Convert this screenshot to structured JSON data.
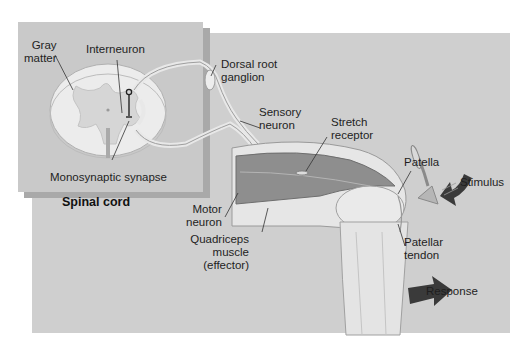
{
  "figure": {
    "inset_title": "Spinal cord",
    "colors": {
      "panel_bg": "#cfcfcf",
      "inset_bg": "#c9c9c9",
      "inset_shadow": "#a9a9a9",
      "arrow": "#3a3a3a",
      "label_text": "#1e1e1e"
    }
  },
  "labels": {
    "gray_matter": [
      "Gray",
      "matter"
    ],
    "interneuron": [
      "Interneuron"
    ],
    "dorsal_root_ganglion": [
      "Dorsal root",
      "ganglion"
    ],
    "sensory_neuron": [
      "Sensory",
      "neuron"
    ],
    "stretch_receptor": [
      "Stretch",
      "receptor"
    ],
    "patella": [
      "Patella"
    ],
    "stimulus": [
      "Stimulus"
    ],
    "monosynaptic_synapse": [
      "Monosynaptic synapse"
    ],
    "motor_neuron": [
      "Motor",
      "neuron"
    ],
    "quadriceps": [
      "Quadriceps",
      "muscle",
      "(effector)"
    ],
    "patellar_tendon": [
      "Patellar",
      "tendon"
    ],
    "response": [
      "Response"
    ]
  }
}
